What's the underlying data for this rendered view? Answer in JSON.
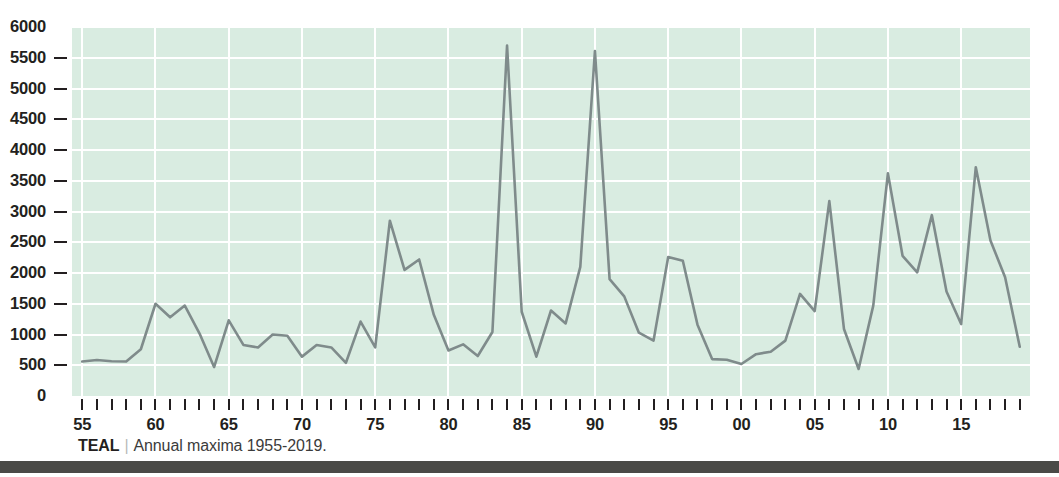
{
  "caption": {
    "source": "TEAL",
    "separator": "|",
    "text": "Annual maxima 1955-2019."
  },
  "colors": {
    "plot_background": "#d9ece1",
    "gridline": "#ffffff",
    "line": "#7f8b8b",
    "axis_text": "#231f20",
    "caption_text": "#3b3b3b",
    "bottom_bar": "#4a4a47",
    "page_background": "#ffffff"
  },
  "chart_data": {
    "type": "line",
    "title": "",
    "subtitle": "",
    "xlabel": "",
    "ylabel": "",
    "xlim": [
      1954.3,
      2019.7
    ],
    "ylim": [
      0,
      6000
    ],
    "grid": true,
    "grid_axes": "both",
    "legend": "none",
    "y_ticks": [
      0,
      500,
      1000,
      1500,
      2000,
      2500,
      3000,
      3500,
      4000,
      4500,
      5000,
      5500,
      6000
    ],
    "y_tick_labels": [
      "0",
      "500",
      "1000",
      "1500",
      "2000",
      "2500",
      "3000",
      "3500",
      "4000",
      "4500",
      "5000",
      "5500",
      "6000"
    ],
    "x_major_ticks": [
      1955,
      1960,
      1965,
      1970,
      1975,
      1980,
      1985,
      1990,
      1995,
      2000,
      2005,
      2010,
      2015
    ],
    "x_major_labels": [
      "55",
      "60",
      "65",
      "70",
      "75",
      "80",
      "85",
      "90",
      "95",
      "00",
      "05",
      "10",
      "15"
    ],
    "x_minor_tick_step": 1,
    "x_minor_range": [
      1955,
      2019
    ],
    "series": [
      {
        "name": "Annual maxima",
        "x": [
          1955,
          1956,
          1957,
          1958,
          1959,
          1960,
          1961,
          1962,
          1963,
          1964,
          1965,
          1966,
          1967,
          1968,
          1969,
          1970,
          1971,
          1972,
          1973,
          1974,
          1975,
          1976,
          1977,
          1978,
          1979,
          1980,
          1981,
          1982,
          1983,
          1984,
          1985,
          1986,
          1987,
          1988,
          1989,
          1990,
          1991,
          1992,
          1993,
          1994,
          1995,
          1996,
          1997,
          1998,
          1999,
          2000,
          2001,
          2002,
          2003,
          2004,
          2005,
          2006,
          2007,
          2008,
          2009,
          2010,
          2011,
          2012,
          2013,
          2014,
          2015,
          2016,
          2017,
          2018,
          2019
        ],
        "values": [
          560,
          585,
          565,
          560,
          760,
          1500,
          1280,
          1470,
          1020,
          470,
          1230,
          830,
          790,
          1000,
          980,
          640,
          830,
          790,
          540,
          1210,
          790,
          2850,
          2050,
          2220,
          1320,
          740,
          840,
          650,
          1040,
          5700,
          1370,
          640,
          1390,
          1180,
          2100,
          5610,
          1900,
          1620,
          1030,
          900,
          2260,
          2200,
          1160,
          600,
          590,
          520,
          680,
          720,
          900,
          1660,
          1380,
          3170,
          1090,
          440,
          1470,
          3620,
          2280,
          2010,
          2940,
          1700,
          1170,
          3720,
          2530,
          1930,
          800
        ]
      }
    ]
  }
}
